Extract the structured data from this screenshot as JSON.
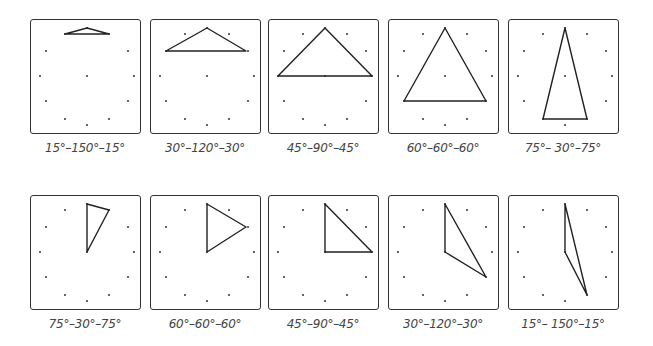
{
  "rows": [
    {
      "panels": [
        {
          "label": "15°–150°–15°",
          "left": 30,
          "top": 19,
          "points": [
            [
              56,
              8
            ],
            [
              34,
              14
            ],
            [
              78,
              14
            ]
          ]
        },
        {
          "label": "30°–120°–30°",
          "left": 150,
          "top": 19,
          "points": [
            [
              56,
              8
            ],
            [
              15,
              31
            ],
            [
              95,
              31
            ]
          ]
        },
        {
          "label": "45°–90°–45°",
          "left": 268,
          "top": 19,
          "points": [
            [
              56,
              8
            ],
            [
              9,
              56
            ],
            [
              103,
              56
            ]
          ]
        },
        {
          "label": "60°–60°–60°",
          "left": 388,
          "top": 19,
          "points": [
            [
              56,
              8
            ],
            [
              15,
              81
            ],
            [
              97,
              81
            ]
          ]
        },
        {
          "label": "75°– 30°–75°",
          "left": 508,
          "top": 19,
          "points": [
            [
              56,
              8
            ],
            [
              34,
              99
            ],
            [
              78,
              99
            ]
          ]
        }
      ]
    },
    {
      "panels": [
        {
          "label": "75°–30°–75°",
          "left": 30,
          "top": 195,
          "points": [
            [
              56,
              8
            ],
            [
              78,
              14
            ],
            [
              56,
              56
            ]
          ]
        },
        {
          "label": "60°–60°–60°",
          "left": 150,
          "top": 195,
          "points": [
            [
              56,
              8
            ],
            [
              95,
              31
            ],
            [
              56,
              56
            ]
          ]
        },
        {
          "label": "45°–90°–45°",
          "left": 268,
          "top": 195,
          "points": [
            [
              56,
              8
            ],
            [
              103,
              56
            ],
            [
              56,
              56
            ]
          ]
        },
        {
          "label": "30°–120°–30°",
          "left": 388,
          "top": 195,
          "points": [
            [
              56,
              8
            ],
            [
              97,
              81
            ],
            [
              56,
              56
            ]
          ]
        },
        {
          "label": "15°– 150°–15°",
          "left": 508,
          "top": 195,
          "points": [
            [
              56,
              8
            ],
            [
              78,
              99
            ],
            [
              56,
              56
            ]
          ]
        }
      ]
    }
  ],
  "geoboard": {
    "center": [
      56,
      56
    ],
    "dots": [
      [
        56,
        8
      ],
      [
        34,
        14
      ],
      [
        78,
        14
      ],
      [
        15,
        31
      ],
      [
        97,
        31
      ],
      [
        9,
        56
      ],
      [
        103,
        56
      ],
      [
        15,
        81
      ],
      [
        97,
        81
      ],
      [
        34,
        99
      ],
      [
        78,
        99
      ],
      [
        56,
        105
      ]
    ]
  }
}
